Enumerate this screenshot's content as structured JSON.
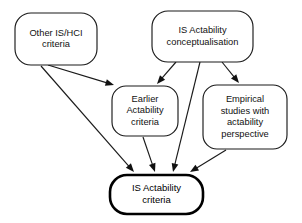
{
  "diagram": {
    "type": "flow-diagram",
    "background_color": "#ffffff",
    "line_color": "#1a1a1a",
    "text_color": "#111111",
    "nodes": [
      {
        "id": "other-is-hci-criteria",
        "label": "Other IS/HCI criteria",
        "lines": [
          "Other IS/HCI",
          "criteria"
        ],
        "emphasis": false,
        "x": 15,
        "y": 13,
        "width": 82,
        "height": 52,
        "radius": 16
      },
      {
        "id": "is-actability-conceptualisation",
        "label": "IS Actability conceptualisation",
        "lines": [
          "IS Actability",
          "conceptualisation"
        ],
        "emphasis": false,
        "x": 152,
        "y": 11,
        "width": 101,
        "height": 51,
        "radius": 16
      },
      {
        "id": "earlier-actability-criteria",
        "label": "Earlier Actability criteria",
        "lines": [
          "Earlier",
          "Actability",
          "criteria"
        ],
        "emphasis": false,
        "x": 112,
        "y": 86,
        "width": 66,
        "height": 50,
        "radius": 14
      },
      {
        "id": "empirical-studies",
        "label": "Empirical studies with actability perspective",
        "lines": [
          "Empirical",
          "studies with",
          "actability",
          "perspective"
        ],
        "emphasis": false,
        "x": 203,
        "y": 85,
        "width": 84,
        "height": 64,
        "radius": 14
      },
      {
        "id": "is-actability-criteria",
        "label": "IS Actability criteria",
        "lines": [
          "IS Actability",
          "criteria"
        ],
        "emphasis": true,
        "x": 110,
        "y": 175,
        "width": 93,
        "height": 39,
        "radius": 17
      }
    ],
    "edges": [
      {
        "id": "other-to-earlier",
        "from": "other-is-hci-criteria",
        "to": "earlier-actability-criteria",
        "x1": 48,
        "y1": 65,
        "x2": 114,
        "y2": 85
      },
      {
        "id": "other-to-result",
        "from": "other-is-hci-criteria",
        "to": "is-actability-criteria",
        "x1": 41,
        "y1": 66,
        "x2": 134,
        "y2": 172
      },
      {
        "id": "conceptualisation-to-earlier",
        "from": "is-actability-conceptualisation",
        "to": "earlier-actability-criteria",
        "x1": 176,
        "y1": 62,
        "x2": 157,
        "y2": 84
      },
      {
        "id": "conceptualisation-to-result",
        "from": "is-actability-conceptualisation",
        "to": "is-actability-criteria",
        "x1": 200,
        "y1": 62,
        "x2": 173,
        "y2": 172
      },
      {
        "id": "conceptualisation-to-empirical",
        "from": "is-actability-conceptualisation",
        "to": "empirical-studies",
        "x1": 222,
        "y1": 62,
        "x2": 239,
        "y2": 83
      },
      {
        "id": "earlier-to-result",
        "from": "earlier-actability-criteria",
        "to": "is-actability-criteria",
        "x1": 143,
        "y1": 137,
        "x2": 155,
        "y2": 172
      },
      {
        "id": "empirical-to-result",
        "from": "empirical-studies",
        "to": "is-actability-criteria",
        "x1": 226,
        "y1": 150,
        "x2": 190,
        "y2": 172
      }
    ]
  }
}
